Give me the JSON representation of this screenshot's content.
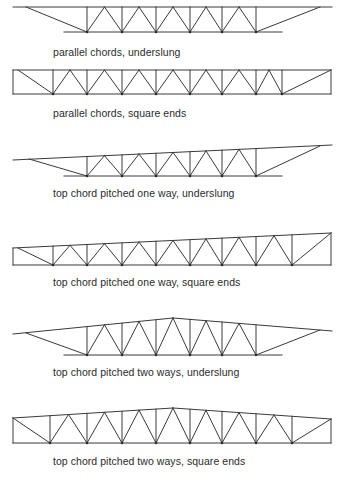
{
  "figure": {
    "stroke_color": "#3a3a3a",
    "text_color": "#2b2b2b"
  },
  "trusses": [
    {
      "id": "parallel-underslung",
      "caption": "parallel chords, underslung",
      "caption_y": 46,
      "top_chord": [
        [
          13,
          7
        ],
        [
          332,
          7
        ]
      ],
      "bottom_chord": [
        [
          64,
          32
        ],
        [
          282,
          32
        ]
      ],
      "end_diagonals": [
        [
          [
            26,
            7
          ],
          [
            87,
            32
          ]
        ],
        [
          [
            256,
            32
          ],
          [
            320,
            7
          ]
        ]
      ],
      "bottom_nodes_x": [
        87,
        122,
        156,
        190,
        222,
        256
      ],
      "bottom_y": 32,
      "top_profile": [
        [
          13,
          7
        ],
        [
          332,
          7
        ]
      ],
      "end_verticals": []
    },
    {
      "id": "parallel-square",
      "caption": "parallel chords, square ends",
      "caption_y": 107,
      "top_chord": [
        [
          13,
          70
        ],
        [
          331,
          70
        ]
      ],
      "bottom_chord": [
        [
          13,
          94
        ],
        [
          331,
          94
        ]
      ],
      "end_diagonals": [
        [
          [
            18,
            70
          ],
          [
            53,
            94
          ]
        ],
        [
          [
            282,
            94
          ],
          [
            331,
            70
          ]
        ]
      ],
      "bottom_nodes_x": [
        53,
        87,
        122,
        156,
        190,
        222,
        256,
        282
      ],
      "bottom_y": 94,
      "top_profile": [
        [
          13,
          70
        ],
        [
          331,
          70
        ]
      ],
      "end_verticals": [
        13,
        331
      ]
    },
    {
      "id": "pitched-one-way-underslung",
      "caption": "top chord pitched one way, underslung",
      "caption_y": 187,
      "top_chord": [
        [
          13,
          160
        ],
        [
          332,
          145
        ]
      ],
      "bottom_chord": [
        [
          64,
          176
        ],
        [
          282,
          176
        ]
      ],
      "end_diagonals": [
        [
          [
            29,
            159
          ],
          [
            87,
            176
          ]
        ],
        [
          [
            256,
            176
          ],
          [
            320,
            146
          ]
        ]
      ],
      "bottom_nodes_x": [
        87,
        122,
        156,
        190,
        222,
        256
      ],
      "bottom_y": 176,
      "top_profile": [
        [
          13,
          160
        ],
        [
          332,
          145
        ]
      ],
      "end_verticals": []
    },
    {
      "id": "pitched-one-way-square",
      "caption": "top chord pitched one way, square ends",
      "caption_y": 276,
      "top_chord": [
        [
          13,
          248
        ],
        [
          331,
          233
        ]
      ],
      "bottom_chord": [
        [
          13,
          265
        ],
        [
          331,
          265
        ]
      ],
      "end_diagonals": [
        [
          [
            18,
            248
          ],
          [
            53,
            265
          ]
        ],
        [
          [
            292,
            265
          ],
          [
            331,
            233
          ]
        ]
      ],
      "bottom_nodes_x": [
        53,
        87,
        122,
        156,
        190,
        222,
        256,
        292
      ],
      "bottom_y": 265,
      "top_profile": [
        [
          13,
          248
        ],
        [
          331,
          233
        ]
      ],
      "end_verticals": [
        13,
        331
      ]
    },
    {
      "id": "pitched-two-ways-underslung",
      "caption": "top chord pitched two ways, underslung",
      "caption_y": 366,
      "top_chord": [
        [
          13,
          334
        ],
        [
          173,
          318
        ],
        [
          332,
          331
        ]
      ],
      "bottom_chord": [
        [
          64,
          355
        ],
        [
          282,
          355
        ]
      ],
      "end_diagonals": [
        [
          [
            26,
            333
          ],
          [
            87,
            355
          ]
        ],
        [
          [
            256,
            355
          ],
          [
            320,
            330
          ]
        ]
      ],
      "bottom_nodes_x": [
        87,
        122,
        156,
        190,
        222,
        256
      ],
      "bottom_y": 355,
      "top_profile": [
        [
          13,
          334
        ],
        [
          173,
          318
        ],
        [
          332,
          331
        ]
      ],
      "end_verticals": []
    },
    {
      "id": "pitched-two-ways-square",
      "caption": "top chord pitched two ways, square ends",
      "caption_y": 455,
      "top_chord": [
        [
          13,
          418
        ],
        [
          173,
          408
        ],
        [
          331,
          419
        ]
      ],
      "bottom_chord": [
        [
          13,
          443
        ],
        [
          331,
          443
        ]
      ],
      "end_diagonals": [
        [
          [
            13,
            418
          ],
          [
            50,
            443
          ]
        ],
        [
          [
            292,
            443
          ],
          [
            331,
            419
          ]
        ]
      ],
      "bottom_nodes_x": [
        50,
        87,
        122,
        156,
        190,
        222,
        256,
        292
      ],
      "bottom_y": 443,
      "top_profile": [
        [
          13,
          418
        ],
        [
          173,
          408
        ],
        [
          331,
          419
        ]
      ],
      "end_verticals": [
        13,
        331
      ]
    }
  ]
}
